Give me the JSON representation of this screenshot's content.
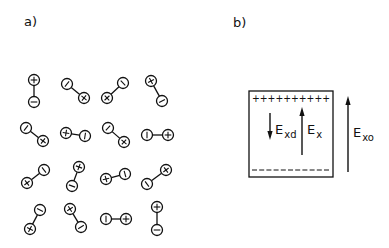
{
  "panel_a": {
    "label": "a)",
    "dipole_radius": 5.5,
    "dipoles": [
      {
        "plus": [
          34,
          80
        ],
        "minus": [
          34,
          102
        ]
      },
      {
        "plus": [
          84,
          98
        ],
        "minus": [
          67,
          84
        ]
      },
      {
        "plus": [
          107,
          98
        ],
        "minus": [
          123,
          83
        ]
      },
      {
        "plus": [
          151,
          81
        ],
        "minus": [
          162,
          101
        ]
      },
      {
        "plus": [
          43,
          141
        ],
        "minus": [
          26,
          128
        ]
      },
      {
        "plus": [
          66,
          133
        ],
        "minus": [
          85,
          136
        ]
      },
      {
        "plus": [
          124,
          142
        ],
        "minus": [
          108,
          128
        ]
      },
      {
        "plus": [
          168,
          135
        ],
        "minus": [
          147,
          135
        ]
      },
      {
        "plus": [
          27,
          183
        ],
        "minus": [
          44,
          170
        ]
      },
      {
        "plus": [
          79,
          167
        ],
        "minus": [
          72,
          186
        ]
      },
      {
        "plus": [
          106,
          179
        ],
        "minus": [
          125,
          174
        ]
      },
      {
        "plus": [
          166,
          170
        ],
        "minus": [
          147,
          184
        ]
      },
      {
        "plus": [
          30,
          229
        ],
        "minus": [
          40,
          210
        ]
      },
      {
        "plus": [
          70,
          209
        ],
        "minus": [
          81,
          227
        ]
      },
      {
        "plus": [
          126,
          219
        ],
        "minus": [
          106,
          219
        ]
      },
      {
        "plus": [
          157,
          207
        ],
        "minus": [
          157,
          230
        ]
      }
    ]
  },
  "panel_b": {
    "label": "b)",
    "box": {
      "x": 249,
      "y": 91,
      "w": 84,
      "h": 86
    },
    "plus_row": "++++++++++",
    "minus_row": "- - - - - - - - - - -",
    "arrows": [
      {
        "name": "E_xd",
        "main": "E",
        "sub": "xd",
        "x": 270,
        "y_from": 113,
        "y_to": 140,
        "direction": "down",
        "label_x": 275,
        "label_y": 134
      },
      {
        "name": "E_x",
        "main": "E",
        "sub": "x",
        "x": 302,
        "y_from": 155,
        "y_to": 107,
        "direction": "up",
        "label_x": 307,
        "label_y": 134
      },
      {
        "name": "E_xo",
        "main": "E",
        "sub": "xo",
        "x": 348,
        "y_from": 172,
        "y_to": 96,
        "direction": "up",
        "label_x": 353,
        "label_y": 137
      }
    ]
  }
}
